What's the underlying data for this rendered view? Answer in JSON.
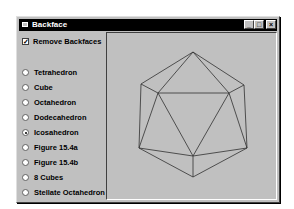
{
  "window": {
    "title": "Backface",
    "controls": {
      "minimize": "_",
      "maximize": "□",
      "close": "×"
    }
  },
  "options": {
    "remove_backfaces": {
      "label": "Remove Backfaces",
      "checked": true
    }
  },
  "shapes": {
    "selected": "Icosahedron",
    "items": [
      {
        "label": "Tetrahedron",
        "selected": false
      },
      {
        "label": "Cube",
        "selected": false
      },
      {
        "label": "Octahedron",
        "selected": false
      },
      {
        "label": "Dodecahedron",
        "selected": false
      },
      {
        "label": "Icosahedron",
        "selected": true
      },
      {
        "label": "Figure 15.4a",
        "selected": false
      },
      {
        "label": "Figure 15.4b",
        "selected": false
      },
      {
        "label": "8 Cubes",
        "selected": false
      },
      {
        "label": "Stellate Octahedron",
        "selected": false
      }
    ]
  },
  "canvas": {
    "shape": "icosahedron",
    "line_color": "#303030",
    "vertices": {
      "top": [
        192,
        51
      ],
      "ul": [
        140,
        83
      ],
      "ur": [
        243,
        84
      ],
      "il": [
        157,
        92
      ],
      "ir": [
        228,
        92
      ],
      "ll": [
        138,
        147
      ],
      "lr": [
        246,
        147
      ],
      "cb": [
        192,
        155
      ],
      "bottom": [
        192,
        176
      ]
    }
  }
}
